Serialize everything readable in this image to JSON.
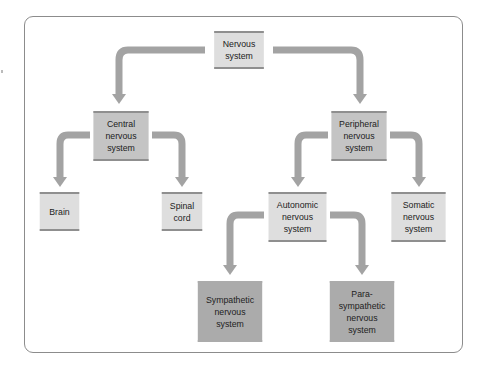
{
  "diagram": {
    "colors": {
      "frame": "#8c8c8c",
      "arrow": "#a3a3a3",
      "box_light": "#dedede",
      "box_mid": "#c4c4c4",
      "box_dark": "#ababab"
    },
    "nodes": {
      "root": {
        "label": "Nervous\nsystem"
      },
      "central": {
        "label": "Central\nnervous\nsystem"
      },
      "peripheral": {
        "label": "Peripheral\nnervous\nsystem"
      },
      "brain": {
        "label": "Brain"
      },
      "spinal": {
        "label": "Spinal\ncord"
      },
      "autonomic": {
        "label": "Autonomic\nnervous\nsystem"
      },
      "somatic": {
        "label": "Somatic\nnervous\nsystem"
      },
      "sympathetic": {
        "label": "Sympathetic\nnervous\nsystem"
      },
      "parasympathetic": {
        "label": "Para-\nsympathetic\nnervous\nsystem"
      }
    },
    "edges": [
      [
        "root",
        "central"
      ],
      [
        "root",
        "peripheral"
      ],
      [
        "central",
        "brain"
      ],
      [
        "central",
        "spinal"
      ],
      [
        "peripheral",
        "autonomic"
      ],
      [
        "peripheral",
        "somatic"
      ],
      [
        "autonomic",
        "sympathetic"
      ],
      [
        "autonomic",
        "parasympathetic"
      ]
    ]
  }
}
